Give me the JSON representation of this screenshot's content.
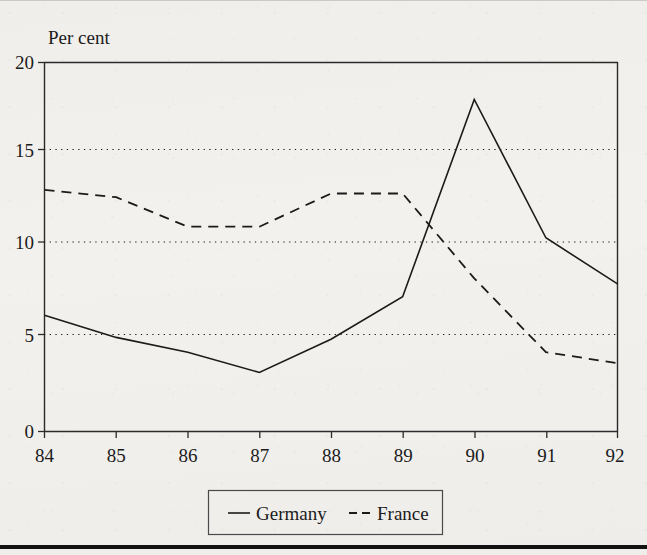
{
  "figure": {
    "background_color": "#f3f1ee",
    "ink_color": "#1b1b1b",
    "y_axis_caption": "Per cent",
    "bottom_rule_color": "#121212"
  },
  "chart_data": {
    "type": "line",
    "title": "",
    "subtitle": "",
    "xlabel": "",
    "ylabel": "Per cent",
    "x": [
      "84",
      "85",
      "86",
      "87",
      "88",
      "89",
      "90",
      "91",
      "92"
    ],
    "categories": [
      "84",
      "85",
      "86",
      "87",
      "88",
      "89",
      "90",
      "91",
      "92"
    ],
    "series": [
      {
        "name": "Germany",
        "style": "solid",
        "color": "#1b1b1b",
        "values": [
          6.3,
          5.1,
          4.3,
          3.2,
          5.0,
          7.3,
          18.0,
          10.5,
          8.0
        ]
      },
      {
        "name": "France",
        "style": "dashed",
        "color": "#1b1b1b",
        "values": [
          13.1,
          12.7,
          11.1,
          11.1,
          12.9,
          12.9,
          8.3,
          4.3,
          3.7
        ]
      }
    ],
    "xlim": [
      "84",
      "92"
    ],
    "ylim": [
      0,
      20
    ],
    "yticks": [
      0,
      5,
      10,
      15,
      20
    ],
    "ytick_labels": [
      "0",
      "5",
      "10",
      "15",
      "20"
    ],
    "xtick_labels": [
      "84",
      "85",
      "86",
      "87",
      "88",
      "89",
      "90",
      "91",
      "92"
    ],
    "grid": true,
    "grid_style": "dotted-horizontal",
    "gridlines_at": [
      5,
      10,
      15
    ],
    "legend_position": "below-center",
    "legend_entries": [
      {
        "label": "Germany",
        "style": "solid"
      },
      {
        "label": "France",
        "style": "dashed"
      }
    ]
  }
}
